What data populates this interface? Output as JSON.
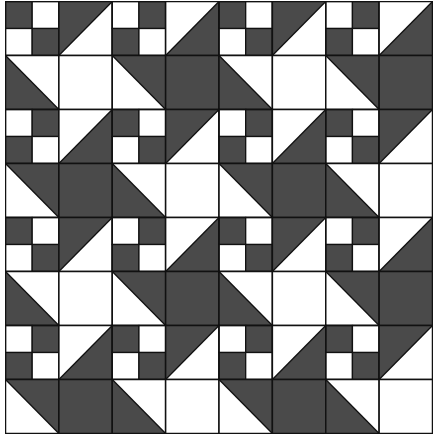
{
  "pattern": {
    "type": "quilt-tessellation",
    "grid": {
      "rows": 8,
      "cols": 8,
      "tile_rows": 4,
      "tile_cols": 4
    },
    "colors": {
      "dark": "#4a4a4a",
      "light": "#ffffff",
      "line": "#111111"
    },
    "tile": [
      [
        {
          "kind": "four",
          "tl": "D",
          "tr": "L",
          "bl": "L",
          "br": "D"
        },
        {
          "kind": "tri",
          "diag": "bl-tr",
          "dark": "ul"
        },
        {
          "kind": "four",
          "tl": "L",
          "tr": "D",
          "bl": "D",
          "br": "L"
        },
        {
          "kind": "tri",
          "diag": "bl-tr",
          "dark": "lr"
        }
      ],
      [
        {
          "kind": "tri",
          "diag": "tl-br",
          "dark": "ll"
        },
        {
          "kind": "solid",
          "fill": "L"
        },
        {
          "kind": "tri",
          "diag": "tl-br",
          "dark": "ur"
        },
        {
          "kind": "solid",
          "fill": "D"
        }
      ],
      [
        {
          "kind": "four",
          "tl": "L",
          "tr": "D",
          "bl": "D",
          "br": "L"
        },
        {
          "kind": "tri",
          "diag": "bl-tr",
          "dark": "lr"
        },
        {
          "kind": "four",
          "tl": "D",
          "tr": "L",
          "bl": "L",
          "br": "D"
        },
        {
          "kind": "tri",
          "diag": "bl-tr",
          "dark": "ul"
        }
      ],
      [
        {
          "kind": "tri",
          "diag": "tl-br",
          "dark": "ur"
        },
        {
          "kind": "solid",
          "fill": "D"
        },
        {
          "kind": "tri",
          "diag": "tl-br",
          "dark": "ll"
        },
        {
          "kind": "solid",
          "fill": "L"
        }
      ]
    ]
  }
}
